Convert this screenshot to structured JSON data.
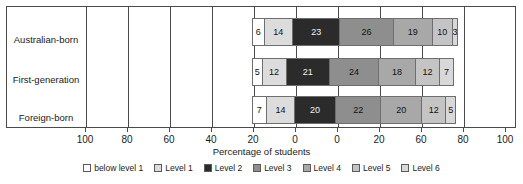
{
  "chart_data": {
    "type": "bar",
    "subtype": "stacked-horizontal",
    "title": "",
    "xlabel": "Percentage of students",
    "ylabel": "",
    "categories": [
      "Australian-born",
      "First-generation",
      "Foreign-born"
    ],
    "legend_position": "bottom",
    "grid": true,
    "xtick_labels": [
      "100",
      "80",
      "60",
      "40",
      "20",
      "0",
      "0",
      "20",
      "60",
      "80",
      "100"
    ],
    "series": [
      {
        "name": "below level 1",
        "color": "#ffffff",
        "values": [
          6,
          5,
          7
        ]
      },
      {
        "name": "Level 1",
        "color": "#dcdcdc",
        "values": [
          14,
          12,
          14
        ]
      },
      {
        "name": "Level 2",
        "color": "#2b2b2b",
        "values": [
          23,
          21,
          20
        ]
      },
      {
        "name": "Level 3",
        "color": "#8e8e8e",
        "values": [
          26,
          24,
          22
        ]
      },
      {
        "name": "Level 4",
        "color": "#a8a8a8",
        "values": [
          19,
          18,
          20
        ]
      },
      {
        "name": "Level 5",
        "color": "#c4c4c4",
        "values": [
          10,
          12,
          12
        ]
      },
      {
        "name": "Level 6",
        "color": "#d8d8d8",
        "values": [
          3,
          7,
          5
        ]
      }
    ]
  },
  "axis": {
    "title": "Percentage of students",
    "ticks": [
      {
        "label": "100",
        "x": 85
      },
      {
        "label": "80",
        "x": 127
      },
      {
        "label": "60",
        "x": 169
      },
      {
        "label": "40",
        "x": 211
      },
      {
        "label": "20",
        "x": 253
      },
      {
        "label": "0",
        "x": 295
      },
      {
        "label": "0",
        "x": 337
      },
      {
        "label": "20",
        "x": 379
      },
      {
        "label": "60",
        "x": 421
      },
      {
        "label": "80",
        "x": 463
      },
      {
        "label": "100",
        "x": 505
      }
    ]
  },
  "legend": {
    "items": [
      {
        "label": "below level 1",
        "color": "#ffffff"
      },
      {
        "label": "Level 1",
        "color": "#dcdcdc"
      },
      {
        "label": "Level 2",
        "color": "#2b2b2b"
      },
      {
        "label": "Level 3",
        "color": "#8e8e8e"
      },
      {
        "label": "Level 4",
        "color": "#a8a8a8"
      },
      {
        "label": "Level 5",
        "color": "#c4c4c4"
      },
      {
        "label": "Level 6",
        "color": "#d8d8d8"
      }
    ]
  },
  "layout": {
    "bar_start_x": 246,
    "unit_px": 2.1,
    "row_tops": [
      12,
      52,
      90
    ],
    "gridlines_x": [
      79,
      121,
      163,
      205,
      247,
      289,
      331,
      373,
      415,
      457
    ],
    "cat_label_tops": [
      28,
      68,
      106
    ]
  }
}
